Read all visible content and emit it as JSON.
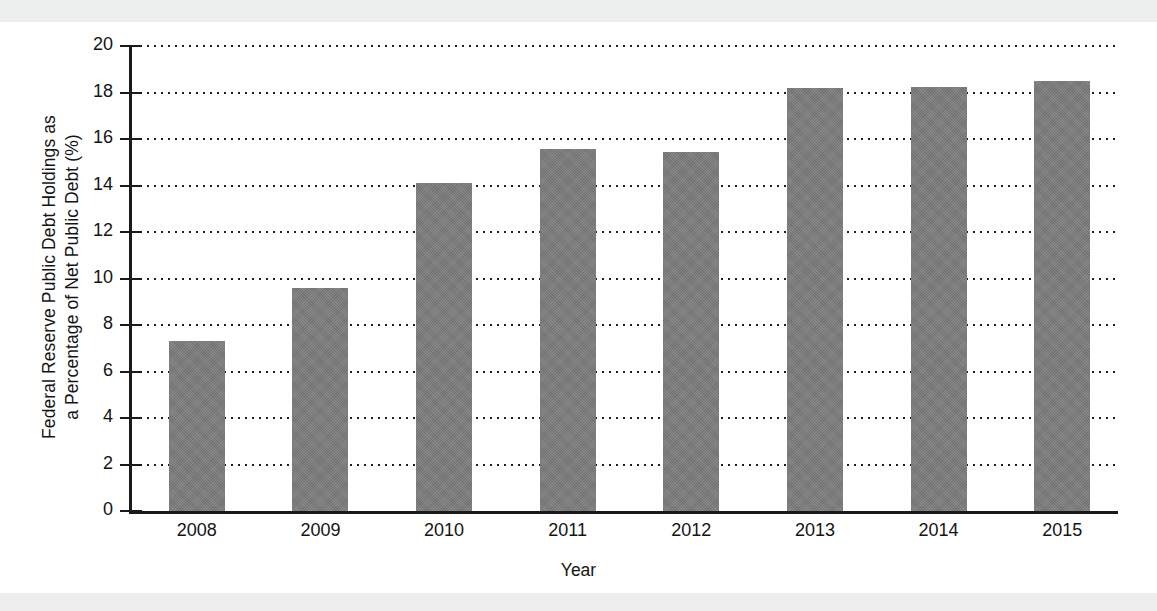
{
  "figure": {
    "y_axis_title_line1": "Federal Reserve Public Debt Holdings as",
    "y_axis_title_line2": "a Percentage of Net Public Debt (%)",
    "x_axis_title": "Year"
  },
  "colors": {
    "bar_fill": "#7c7c7c",
    "axis": "#1a1a1a",
    "grid": "#1f1f1f",
    "text": "#141414",
    "page_background": "#ffffff",
    "scan_band": "#eceded"
  },
  "chart_data": {
    "type": "bar",
    "title": "",
    "xlabel": "Year",
    "ylabel": "Federal Reserve Public Debt Holdings as a Percentage of Net Public Debt (%)",
    "categories": [
      "2008",
      "2009",
      "2010",
      "2011",
      "2012",
      "2013",
      "2014",
      "2015"
    ],
    "values": [
      7.3,
      9.6,
      14.1,
      15.55,
      15.45,
      18.2,
      18.25,
      18.5
    ],
    "ylim": [
      0,
      20
    ],
    "ytick_labels": [
      "0",
      "2",
      "4",
      "6",
      "8",
      "10",
      "12",
      "14",
      "16",
      "18",
      "20"
    ],
    "ytick_values": [
      0,
      2,
      4,
      6,
      8,
      10,
      12,
      14,
      16,
      18,
      20
    ],
    "grid": true,
    "grid_style": "dotted-horizontal",
    "legend": null,
    "legend_position": "none",
    "series": [
      {
        "name": "Federal Reserve Public Debt Holdings (% of Net Public Debt)",
        "values": [
          7.3,
          9.6,
          14.1,
          15.55,
          15.45,
          18.2,
          18.25,
          18.5
        ]
      }
    ]
  }
}
